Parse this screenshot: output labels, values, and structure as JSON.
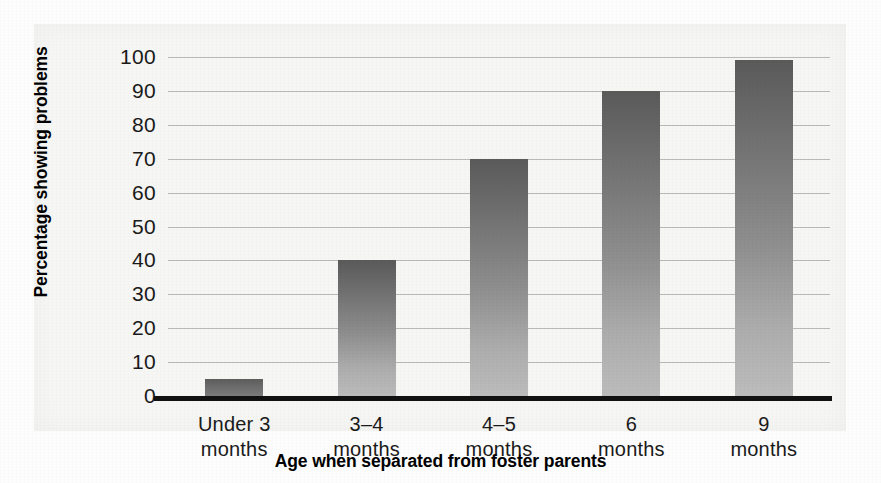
{
  "chart_data": {
    "type": "bar",
    "title": "",
    "xlabel": "Age when separated from foster parents",
    "ylabel": "Percentage showing problems",
    "categories": [
      "Under 3 months",
      "3–4 months",
      "4–5 months",
      "6 months",
      "9 months"
    ],
    "category_lines": [
      [
        "Under 3",
        "months"
      ],
      [
        "3–4",
        "months"
      ],
      [
        "4–5",
        "months"
      ],
      [
        "6",
        "months"
      ],
      [
        "9",
        "months"
      ]
    ],
    "values": [
      5,
      40,
      70,
      90,
      99
    ],
    "ylim": [
      0,
      100
    ],
    "yticks": [
      100,
      90,
      80,
      70,
      60,
      50,
      40,
      30,
      20,
      10,
      0
    ],
    "ytick_labels": [
      "100",
      "90",
      "80",
      "70",
      "60",
      "50",
      "40",
      "30",
      "20",
      "10",
      "0"
    ],
    "grid": true,
    "legend": null,
    "bar_color_top": "#5a5a5a",
    "bar_color_bottom": "#bcbcbc",
    "gridline_color": "#b9b9b9",
    "axis_color": "#111111",
    "panel_color": "#f6f6f4"
  }
}
